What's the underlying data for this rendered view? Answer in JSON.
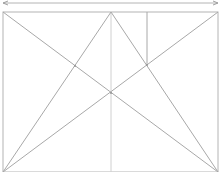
{
  "diagram": {
    "type": "geometric-construction",
    "colors": {
      "line": "#a8a8a8",
      "frame": "#b4b4b4",
      "center_line": "#d0d0d0",
      "background": "#ffffff"
    },
    "elements": [
      "dimension-line-with-arrows",
      "rectangle-frame",
      "diagonal-top-left-to-bottom-right",
      "diagonal-top-right-to-bottom-left",
      "line-apex-to-bottom-left",
      "line-apex-to-bottom-right",
      "vertical-center-line",
      "vertical-line-to-intersection"
    ]
  }
}
